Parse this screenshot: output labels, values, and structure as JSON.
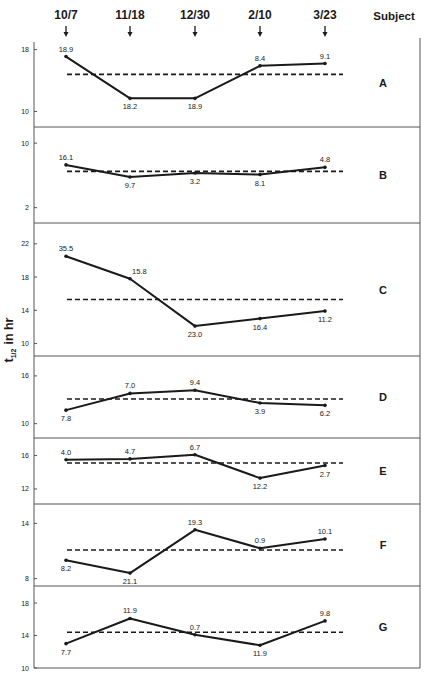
{
  "chart_data": {
    "type": "line",
    "title": "",
    "xlabel": "",
    "ylabel": "t1/2 in hr",
    "ylabel_parts": {
      "main": "t",
      "subscript": "1/2",
      "suffix": "in hr"
    },
    "legend_header": "Subject",
    "categories": [
      "10/7",
      "11/18",
      "12/30",
      "2/10",
      "3/23"
    ],
    "marker_icon": "down-arrow",
    "grid": false,
    "panels": [
      {
        "subject": "A",
        "yticks": [
          10,
          18
        ],
        "ylim": [
          8,
          19.5
        ],
        "values": [
          17.1,
          11.7,
          11.7,
          15.9,
          16.2
        ],
        "point_labels": [
          "18.9",
          "18.2",
          "18.9",
          "8.4",
          "9.1"
        ],
        "label_pos": [
          "above",
          "below",
          "below",
          "above",
          "above"
        ],
        "mean": 14.8
      },
      {
        "subject": "B",
        "yticks": [
          2,
          10
        ],
        "ylim": [
          0.1,
          12
        ],
        "values": [
          7.3,
          5.8,
          6.3,
          6.1,
          7.0
        ],
        "point_labels": [
          "16.1",
          "9.7",
          "3.2",
          "8.1",
          "4.8"
        ],
        "label_pos": [
          "above",
          "below",
          "below",
          "below",
          "above"
        ],
        "mean": 6.5
      },
      {
        "subject": "C",
        "yticks": [
          10,
          14,
          18,
          22
        ],
        "ylim": [
          8.5,
          24.5
        ],
        "values": [
          20.5,
          17.8,
          12.1,
          13.0,
          13.9
        ],
        "point_labels": [
          "35.5",
          "15.8",
          "23.0",
          "16.4",
          "11.2"
        ],
        "label_pos": [
          "above",
          "right",
          "below",
          "below",
          "below"
        ],
        "mean": 15.3
      },
      {
        "subject": "D",
        "yticks": [
          10,
          16
        ],
        "ylim": [
          8.2,
          18.5
        ],
        "values": [
          11.7,
          13.8,
          14.2,
          12.6,
          12.3
        ],
        "point_labels": [
          "7.8",
          "7.0",
          "9.4",
          "3.9",
          "6.2"
        ],
        "label_pos": [
          "below",
          "above",
          "above",
          "below",
          "below"
        ],
        "mean": 13.1
      },
      {
        "subject": "E",
        "yticks": [
          12,
          16
        ],
        "ylim": [
          10.2,
          18.1
        ],
        "values": [
          15.5,
          15.6,
          16.1,
          13.3,
          14.8
        ],
        "point_labels": [
          "4.0",
          "4.7",
          "6.7",
          "12.2",
          "2.7"
        ],
        "label_pos": [
          "above",
          "above",
          "above",
          "below",
          "below"
        ],
        "mean": 15.1
      },
      {
        "subject": "F",
        "yticks": [
          8,
          14
        ],
        "ylim": [
          7.2,
          16.1
        ],
        "values": [
          10.0,
          8.6,
          13.3,
          11.3,
          12.3
        ],
        "point_labels": [
          "8.2",
          "21.1",
          "19.3",
          "0.9",
          "10.1"
        ],
        "label_pos": [
          "below",
          "below",
          "above",
          "above",
          "above"
        ],
        "mean": 11.1
      },
      {
        "subject": "G",
        "yticks": [
          10,
          14,
          18
        ],
        "ylim": [
          10,
          20.1
        ],
        "values": [
          13.0,
          16.1,
          14.1,
          12.8,
          15.8
        ],
        "point_labels": [
          "7.7",
          "11.9",
          "0.7",
          "11.9",
          "9.8"
        ],
        "label_pos": [
          "below",
          "above",
          "above",
          "below",
          "above"
        ],
        "mean": 14.4
      }
    ]
  },
  "layout": {
    "x_positions": [
      66,
      130,
      195,
      260,
      325
    ],
    "mean_line_x": [
      67,
      343
    ],
    "plot_left": 34,
    "plot_right": 420,
    "panel_bounds": [
      [
        38,
        127
      ],
      [
        127,
        223
      ],
      [
        223,
        356
      ],
      [
        356,
        438
      ],
      [
        438,
        504
      ],
      [
        504,
        586
      ],
      [
        586,
        668
      ]
    ],
    "colors": {
      "ink": "#1a1a1a",
      "frame": "#555555",
      "paper": "#ffffff"
    }
  }
}
